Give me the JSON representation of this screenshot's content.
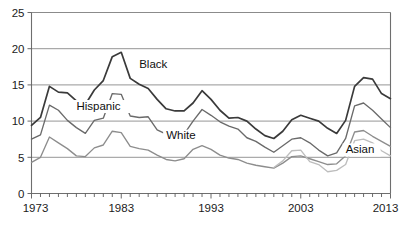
{
  "chart_data": {
    "type": "line",
    "title": "",
    "subtitle": "",
    "xlabel": "",
    "ylabel": "",
    "xlim": [
      1973,
      2013
    ],
    "ylim": [
      0,
      25
    ],
    "grid": "horizontal",
    "legend_position": "inline-annotations",
    "y_ticks": [
      "0",
      "5",
      "10",
      "15",
      "20",
      "25"
    ],
    "y_tick_values": [
      0,
      5,
      10,
      15,
      20,
      25
    ],
    "x_ticks": [
      "1973",
      "1983",
      "1993",
      "2003",
      "2013"
    ],
    "x_tick_values": [
      1973,
      1983,
      1993,
      2003,
      2013
    ],
    "x_minor_tick_interval": 1,
    "x": [
      1973,
      1974,
      1975,
      1976,
      1977,
      1978,
      1979,
      1980,
      1981,
      1982,
      1983,
      1984,
      1985,
      1986,
      1987,
      1988,
      1989,
      1990,
      1991,
      1992,
      1993,
      1994,
      1995,
      1996,
      1997,
      1998,
      1999,
      2000,
      2001,
      2002,
      2003,
      2004,
      2005,
      2006,
      2007,
      2008,
      2009,
      2010,
      2011,
      2012,
      2013
    ],
    "series": [
      {
        "name": "Black",
        "color": "#3a3a3a",
        "label_x": 1985,
        "label_y": 17.4,
        "values": [
          9.4,
          10.5,
          14.8,
          14.0,
          13.9,
          12.8,
          12.3,
          14.3,
          15.6,
          18.9,
          19.5,
          15.9,
          15.1,
          14.5,
          13.0,
          11.7,
          11.4,
          11.4,
          12.5,
          14.2,
          13.0,
          11.5,
          10.4,
          10.5,
          10.0,
          8.9,
          8.0,
          7.6,
          8.6,
          10.2,
          10.8,
          10.4,
          10.0,
          9.0,
          8.3,
          10.1,
          14.8,
          16.0,
          15.8,
          13.8,
          13.1
        ]
      },
      {
        "name": "Hispanic",
        "color": "#6a6a6a",
        "label_x": 1978,
        "label_y": 11.6,
        "values": [
          7.5,
          8.1,
          12.2,
          11.5,
          10.1,
          9.1,
          8.3,
          10.1,
          10.4,
          13.8,
          13.7,
          10.7,
          10.5,
          10.6,
          8.8,
          8.2,
          8.0,
          8.2,
          10.0,
          11.6,
          10.8,
          9.9,
          9.3,
          8.9,
          7.7,
          7.2,
          6.4,
          5.7,
          6.6,
          7.5,
          7.7,
          7.0,
          6.0,
          5.2,
          5.6,
          7.6,
          12.1,
          12.5,
          11.5,
          10.3,
          9.1
        ]
      },
      {
        "name": "White",
        "color": "#8d8d8d",
        "label_x": 1988,
        "label_y": 7.5,
        "values": [
          4.3,
          5.0,
          7.8,
          7.0,
          6.2,
          5.2,
          5.1,
          6.3,
          6.7,
          8.6,
          8.4,
          6.5,
          6.2,
          6.0,
          5.3,
          4.7,
          4.5,
          4.8,
          6.1,
          6.6,
          6.1,
          5.3,
          4.9,
          4.7,
          4.2,
          3.9,
          3.7,
          3.5,
          4.2,
          5.1,
          5.2,
          4.8,
          4.4,
          4.0,
          4.1,
          5.2,
          8.5,
          8.7,
          7.9,
          7.2,
          6.5
        ]
      },
      {
        "name": "Asian",
        "color": "#bdbdbd",
        "label_x": 2008,
        "label_y": 5.6,
        "start_year": 2000,
        "values": [
          null,
          null,
          null,
          null,
          null,
          null,
          null,
          null,
          null,
          null,
          null,
          null,
          null,
          null,
          null,
          null,
          null,
          null,
          null,
          null,
          null,
          null,
          null,
          null,
          null,
          null,
          null,
          3.6,
          4.5,
          5.9,
          6.0,
          4.4,
          4.0,
          3.0,
          3.2,
          4.0,
          7.3,
          7.5,
          7.0,
          5.9,
          5.2
        ]
      }
    ]
  }
}
